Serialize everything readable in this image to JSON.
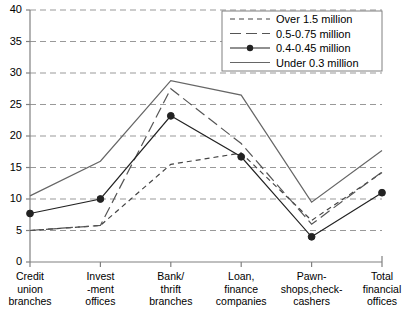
{
  "chart_data": {
    "type": "line",
    "title": "",
    "xlabel": "",
    "ylabel": "",
    "ylim": [
      0,
      40
    ],
    "ytick_step": 5,
    "yticks": [
      "0",
      "5",
      "10",
      "15",
      "20",
      "25",
      "30",
      "35",
      "40"
    ],
    "grid": "horizontal-dashed",
    "legend_position": "top-right",
    "categories": [
      "Credit\nunion\nbranches",
      "Invest\n-ment\noffices",
      "Bank/\nthrift\nbranches",
      "Loan,\nfinance\ncompanies",
      "Pawn-\nshops,check-\ncashers",
      "Total\nfinancial\noffices"
    ],
    "series": [
      {
        "name": "Over 1.5 million",
        "style": "dashed",
        "marker": "none",
        "color": "#444444",
        "values": [
          5.0,
          5.8,
          15.5,
          17.3,
          6.6,
          14.2
        ]
      },
      {
        "name": "0.5-0.75 million",
        "style": "long-dash",
        "marker": "none",
        "color": "#555555",
        "values": [
          5.0,
          5.8,
          27.5,
          18.8,
          6.0,
          14.3
        ]
      },
      {
        "name": "0.4-0.45 million",
        "style": "solid",
        "marker": "filled-circle",
        "color": "#222222",
        "values": [
          7.7,
          10.0,
          23.2,
          16.7,
          4.0,
          11.0
        ]
      },
      {
        "name": "Under 0.3 million",
        "style": "solid",
        "marker": "none",
        "color": "#666666",
        "values": [
          10.5,
          16.0,
          28.8,
          26.5,
          9.5,
          17.7
        ]
      }
    ]
  },
  "axis_colors": {
    "axis": "#808080",
    "grid": "#999999",
    "text": "#000000"
  }
}
